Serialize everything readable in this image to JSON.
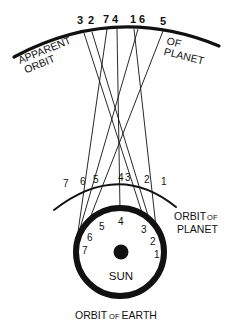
{
  "diagram": {
    "labels": {
      "apparent_orbit_left_1": "APPARENT",
      "apparent_orbit_left_2": "ORBIT",
      "apparent_orbit_right_1": "OF",
      "apparent_orbit_right_2": "PLANET",
      "orbit_of_planet_1": "ORBIT",
      "orbit_of_planet_of": "OF",
      "orbit_of_planet_2": "PLANET",
      "sun": "SUN",
      "orbit_of_earth_1": "ORBIT",
      "orbit_of_earth_of": "OF",
      "orbit_of_earth_2": "EARTH"
    },
    "apparent_positions": [
      {
        "label": "3",
        "x": 80
      },
      {
        "label": "2",
        "x": 92
      },
      {
        "label": "7",
        "x": 107
      },
      {
        "label": "4",
        "x": 118
      },
      {
        "label": "1",
        "x": 135
      },
      {
        "label": "6",
        "x": 146
      },
      {
        "label": "5",
        "x": 164
      }
    ],
    "planet_positions": [
      {
        "label": "7",
        "x": 67,
        "y": 187
      },
      {
        "label": "6",
        "x": 92,
        "y": 185
      },
      {
        "label": "5",
        "x": 106,
        "y": 183
      },
      {
        "label": "4",
        "x": 118,
        "y": 182
      },
      {
        "label": "3",
        "x": 129,
        "y": 182
      },
      {
        "label": "2",
        "x": 147,
        "y": 184
      },
      {
        "label": "1",
        "x": 163,
        "y": 186
      }
    ],
    "earth_positions": [
      {
        "label": "7",
        "x": 72,
        "y": 254
      },
      {
        "label": "6",
        "x": 75,
        "y": 241
      },
      {
        "label": "5",
        "x": 86,
        "y": 228
      },
      {
        "label": "4",
        "x": 122,
        "y": 222
      },
      {
        "label": "3",
        "x": 145,
        "y": 230
      },
      {
        "label": "2",
        "x": 156,
        "y": 242
      },
      {
        "label": "1",
        "x": 160,
        "y": 255
      }
    ],
    "colors": {
      "ink": "#111111",
      "background": "#ffffff"
    }
  }
}
